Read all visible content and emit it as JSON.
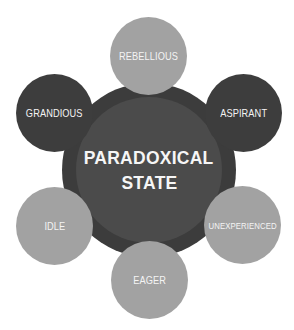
{
  "diagram": {
    "center": {
      "line1": "PARADOXICAL",
      "line2": "STATE"
    },
    "nodes": [
      {
        "label": "REBELLIOUS",
        "position": "top",
        "shade": "light"
      },
      {
        "label": "ASPIRANT",
        "position": "upper-right",
        "shade": "dark"
      },
      {
        "label": "UNEXPERIENCED",
        "position": "lower-right",
        "shade": "light"
      },
      {
        "label": "EAGER",
        "position": "bottom",
        "shade": "light"
      },
      {
        "label": "IDLE",
        "position": "lower-left",
        "shade": "light"
      },
      {
        "label": "GRANDIOUS",
        "position": "upper-left",
        "shade": "dark"
      }
    ],
    "colors": {
      "hub_outer": "#3c3c3c",
      "hub_inner": "#4b4b4b",
      "node_dark": "#3d3d3d",
      "node_light": "#a2a2a2",
      "text": "#f4f4f4",
      "background": "#ffffff"
    }
  }
}
